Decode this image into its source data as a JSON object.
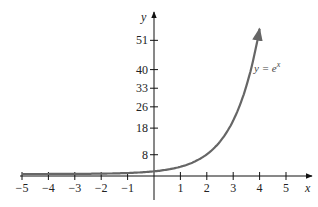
{
  "chart_data": {
    "type": "line",
    "title": "",
    "xlabel": "x",
    "ylabel": "y",
    "xlim": [
      -5,
      5.9
    ],
    "ylim": [
      -9,
      60
    ],
    "x_ticks": [
      -5,
      -4,
      -3,
      -2,
      -1,
      1,
      2,
      3,
      4,
      5
    ],
    "x_tick_labels": [
      "−5",
      "−4",
      "−3",
      "−2",
      "−1",
      "1",
      "2",
      "3",
      "4",
      "5"
    ],
    "y_ticks": [
      8,
      18,
      26,
      33,
      40,
      51
    ],
    "y_tick_labels": [
      "8",
      "18",
      "26",
      "33",
      "40",
      "51"
    ],
    "grid": false,
    "legend": [],
    "series": [
      {
        "name": "y = e^x",
        "color": "#666666",
        "x": [
          -5,
          -4,
          -3,
          -2,
          -1,
          0,
          1,
          2,
          3,
          3.5,
          4
        ],
        "values": [
          0.007,
          0.018,
          0.05,
          0.135,
          0.368,
          1,
          2.718,
          7.389,
          20.09,
          33.12,
          54.6
        ]
      }
    ],
    "annotations": [
      {
        "text_main": "y = e",
        "text_sup": "x",
        "x": 4.1,
        "y": 40
      }
    ]
  },
  "labels": {
    "x_axis": "x",
    "y_axis": "y",
    "equation_main": "y = e",
    "equation_sup": "x"
  }
}
